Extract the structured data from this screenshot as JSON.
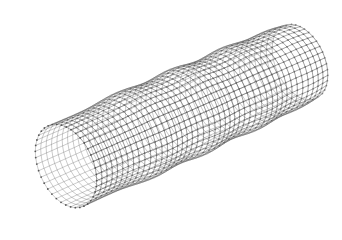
{
  "image": {
    "width": 342,
    "height": 232,
    "background": "#ffffff",
    "subject": "wireframe-tube-mesh"
  },
  "mesh": {
    "line_color": "#5a5a5a",
    "node_color": "#4a4a4a",
    "line_width": 0.7,
    "node_radius": 0.9,
    "axis_start": [
      66,
      166
    ],
    "axis_end": [
      300,
      62
    ],
    "base_radius": 44,
    "ring_count": 44,
    "segments_per_ring": 40,
    "bulges": [
      {
        "t": 0.3,
        "amp": 0.1,
        "width": 0.1
      },
      {
        "t": 0.52,
        "amp": 0.12,
        "width": 0.09
      },
      {
        "t": 0.74,
        "amp": 0.12,
        "width": 0.09
      },
      {
        "t": 0.92,
        "amp": 0.08,
        "width": 0.08
      }
    ],
    "end_ellipse_ratio": 0.62,
    "tilt_deg": 24
  }
}
